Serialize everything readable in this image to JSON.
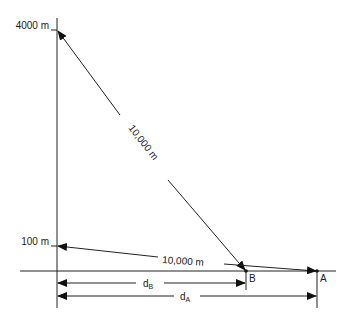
{
  "diagram": {
    "type": "geometry-distance-diagram",
    "vertical_axis": {
      "ticks": [
        {
          "label": "4000 m",
          "y": 30
        },
        {
          "label": "100 m",
          "y": 246
        }
      ]
    },
    "points": {
      "B": {
        "label": "B"
      },
      "A": {
        "label": "A"
      }
    },
    "slant_lines": [
      {
        "from": "4000 m",
        "to": "B",
        "label": "10,000 m"
      },
      {
        "from": "100 m",
        "to": "A",
        "label": "10,000 m"
      }
    ],
    "dimensions": [
      {
        "name": "d_B",
        "main": "d",
        "sub": "B"
      },
      {
        "name": "d_A",
        "main": "d",
        "sub": "A"
      }
    ]
  }
}
